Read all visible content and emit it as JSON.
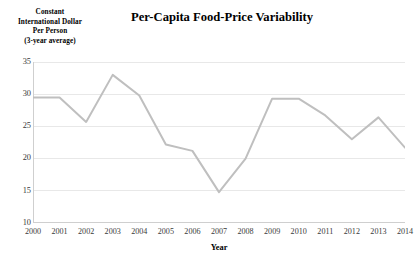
{
  "chart_data": {
    "type": "line",
    "title": "Per-Capita Food-Price Variability",
    "xlabel": "Year",
    "ylabel": "Constant International Dollar Per Person (3-year average)",
    "ylabel_lines": [
      "Constant",
      "International Dollar",
      "Per Person",
      "(3-year average)"
    ],
    "categories": [
      "2000",
      "2001",
      "2002",
      "2003",
      "2004",
      "2006",
      "2006",
      "2007",
      "2008",
      "2009",
      "2010",
      "2011",
      "2012",
      "2013",
      "2014"
    ],
    "x": [
      2000,
      2001,
      2002,
      2003,
      2004,
      2005,
      2006,
      2007,
      2008,
      2009,
      2010,
      2011,
      2012,
      2013,
      2014
    ],
    "x_tick_labels": [
      "2000",
      "2001",
      "2002",
      "2003",
      "2004",
      "2005",
      "2006",
      "2007",
      "2008",
      "2009",
      "2010",
      "2011",
      "2012",
      "2013",
      "2014"
    ],
    "values": [
      29.5,
      29.5,
      25.7,
      33.0,
      29.8,
      22.2,
      21.2,
      14.8,
      20.0,
      29.3,
      29.3,
      26.7,
      23.0,
      26.4,
      21.7
    ],
    "series": [
      {
        "name": "Per-capita food-price variability",
        "color": "#bfbfbf",
        "values": [
          29.5,
          29.5,
          25.7,
          33.0,
          29.8,
          22.2,
          21.2,
          14.8,
          20.0,
          29.3,
          29.3,
          26.7,
          23.0,
          26.4,
          21.7
        ]
      }
    ],
    "ylim": [
      10,
      35
    ],
    "xlim": [
      2000,
      2014
    ],
    "y_ticks": [
      10,
      15,
      20,
      25,
      30,
      35
    ],
    "y_tick_labels": [
      "10",
      "15",
      "20",
      "25",
      "30",
      "35"
    ],
    "grid": "horizontal",
    "legend": "none",
    "markers": "none",
    "line_color": "#bfbfbf",
    "gridline_color": "#e8e8e8",
    "axis_color": "#cfcfcf",
    "background": "#ffffff"
  }
}
